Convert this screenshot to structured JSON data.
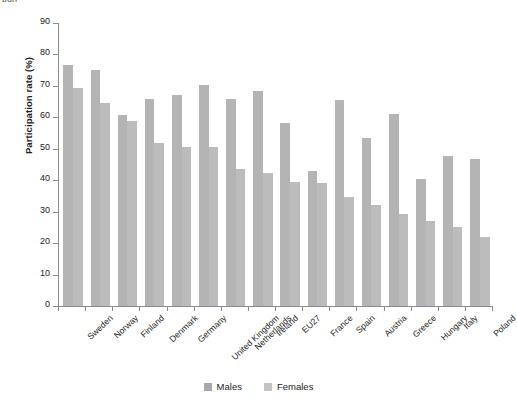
{
  "figure": {
    "clipped_title_fragment": "tion",
    "legend": {
      "position": "bottom-center",
      "entries": [
        {
          "label": "Males",
          "color": "#a9a9a9"
        },
        {
          "label": "Females",
          "color": "#c3c3c3"
        }
      ]
    }
  },
  "chart_data": {
    "type": "bar",
    "title": "",
    "xlabel": "",
    "ylabel": "Participation rate (%)",
    "ylim": [
      0,
      90
    ],
    "ytick_step": 10,
    "yticks": [
      0,
      10,
      20,
      30,
      40,
      50,
      60,
      70,
      80,
      90
    ],
    "ytick_labels": [
      "0",
      "10",
      "20",
      "30",
      "40",
      "50",
      "60",
      "70",
      "80",
      "90"
    ],
    "grid": false,
    "legend_position": "bottom-center",
    "categories": [
      "Sweden",
      "Norway",
      "Finland",
      "Denmark",
      "Germany",
      "United Kingdom",
      "Netherlands",
      "Ireland",
      "EU27",
      "France",
      "Spain",
      "Austria",
      "Greece",
      "Hungary",
      "Italy",
      "Poland"
    ],
    "series": [
      {
        "name": "Males",
        "color": "#b4b4b4",
        "values": [
          76.8,
          75.0,
          60.8,
          65.9,
          67.2,
          70.4,
          65.9,
          68.5,
          58.3,
          42.8,
          65.4,
          53.3,
          61.0,
          40.5,
          47.8,
          46.6
        ]
      },
      {
        "name": "Females",
        "color": "#bcbcbc",
        "values": [
          69.2,
          64.5,
          58.8,
          51.7,
          50.6,
          50.6,
          43.5,
          42.3,
          39.5,
          39.0,
          34.8,
          32.2,
          29.2,
          26.9,
          25.2,
          21.9
        ]
      }
    ]
  }
}
